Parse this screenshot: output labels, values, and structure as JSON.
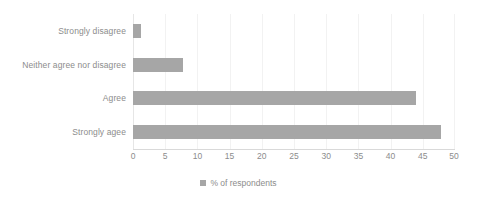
{
  "chart_data": {
    "type": "bar",
    "orientation": "horizontal",
    "title": "",
    "xlabel": "",
    "ylabel": "",
    "categories": [
      "Strongly agee",
      "Agree",
      "Neither agree nor disagree",
      "Strongly disagree"
    ],
    "values": [
      47.8,
      44.0,
      7.8,
      1.3
    ],
    "series": [
      {
        "name": "% of respondents",
        "values": [
          47.8,
          44.0,
          7.8,
          1.3
        ]
      }
    ],
    "xlim": [
      0,
      50
    ],
    "xticks": [
      0,
      5,
      10,
      15,
      20,
      25,
      30,
      35,
      40,
      45,
      50
    ],
    "xtick_labels": [
      "0",
      "5",
      "10",
      "15",
      "20",
      "25",
      "30",
      "35",
      "40",
      "45",
      "50"
    ],
    "grid": true,
    "grid_axis": "x",
    "legend": {
      "position": "bottom",
      "entries": [
        {
          "label": "% of respondents",
          "marker": "square",
          "color": "#a6a6a6"
        }
      ]
    },
    "colors": {
      "bar": "#a6a6a6",
      "text": "#8c8c8c",
      "gridline": "#f2f2f2",
      "axis": "#d9d9d9",
      "background": "#ffffff"
    }
  }
}
